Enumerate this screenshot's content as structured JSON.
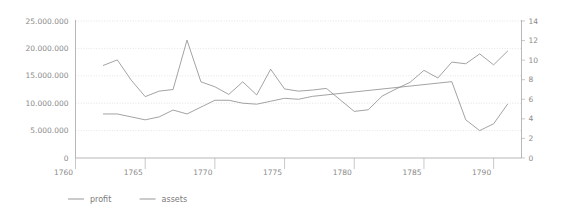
{
  "chart_data": {
    "type": "line",
    "title": "",
    "subtitle": "",
    "xlabel": "",
    "ylabel": "",
    "grid": true,
    "legend_position": "bottom-left",
    "xlim": [
      1760,
      1792
    ],
    "xticks": [
      1760,
      1765,
      1770,
      1775,
      1780,
      1785,
      1790
    ],
    "xtick_labels": [
      "1760",
      "1765",
      "1770",
      "1775",
      "1780",
      "1785",
      "1790"
    ],
    "left_axis": {
      "ylim": [
        0,
        25000000
      ],
      "yticks": [
        0,
        5000000,
        10000000,
        15000000,
        20000000,
        25000000
      ],
      "ytick_labels": [
        "0",
        "5.000.000",
        "10.000.000",
        "15.000.000",
        "20.000.000",
        "25.000.000"
      ]
    },
    "right_axis": {
      "ylim": [
        0,
        14
      ],
      "yticks": [
        0,
        2,
        4,
        6,
        8,
        10,
        12,
        14
      ],
      "ytick_labels": [
        "0",
        "2",
        "4",
        "6",
        "8",
        "10",
        "12",
        "14"
      ]
    },
    "series": [
      {
        "name": "profit",
        "axis": "left",
        "color": "#8c8c8c",
        "x": [
          1762,
          1763,
          1764,
          1765,
          1766,
          1767,
          1768,
          1769,
          1770,
          1771,
          1772,
          1773,
          1774,
          1775,
          1776,
          1777,
          1778,
          1779,
          1780,
          1781,
          1782,
          1783,
          1784,
          1785,
          1786,
          1787,
          1788,
          1789,
          1790,
          1791
        ],
        "values": [
          16900000,
          17900000,
          14200000,
          11200000,
          12200000,
          12500000,
          21500000,
          13900000,
          13000000,
          11600000,
          13900000,
          11500000,
          16200000,
          12600000,
          12200000,
          12400000,
          12700000,
          10600000,
          8500000,
          8800000,
          11300000,
          12600000,
          13800000,
          16000000,
          14600000,
          17500000,
          17200000,
          19000000,
          17000000,
          19500000
        ]
      },
      {
        "name": "assets",
        "axis": "right",
        "color": "#8c8c8c",
        "x": [
          1762,
          1763,
          1764,
          1765,
          1766,
          1767,
          1768,
          1769,
          1770,
          1771,
          1772,
          1773,
          1774,
          1775,
          1776,
          1777,
          1787,
          1788,
          1789,
          1790,
          1791
        ],
        "values": [
          4.5,
          4.5,
          4.2,
          3.9,
          4.2,
          4.9,
          4.5,
          5.2,
          5.9,
          5.9,
          5.6,
          5.5,
          5.8,
          6.1,
          6.0,
          6.3,
          7.8,
          3.9,
          2.8,
          3.5,
          5.5
        ]
      }
    ]
  },
  "legend": {
    "items": [
      {
        "label": "profit"
      },
      {
        "label": "assets"
      }
    ]
  }
}
